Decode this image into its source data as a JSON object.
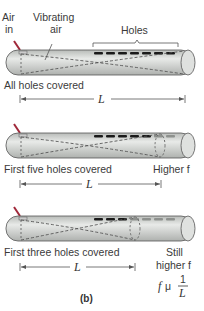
{
  "panel_label": "(b)",
  "labels": {
    "air_in": [
      "Air",
      "in"
    ],
    "vibrating_air": [
      "Vibrating",
      "air"
    ],
    "holes": "Holes",
    "length_symbol": "L"
  },
  "tubes": [
    {
      "caption": "All holes covered",
      "holes_total": 7,
      "holes_covered": 7,
      "right_note": []
    },
    {
      "caption": "First five holes covered",
      "holes_total": 7,
      "holes_covered": 5,
      "right_note": [
        "Higher f"
      ]
    },
    {
      "caption": "First three holes covered",
      "holes_total": 7,
      "holes_covered": 3,
      "right_note": [
        "Still",
        "higher f"
      ]
    }
  ],
  "formula": {
    "lhs": "f",
    "relation": "μ",
    "numerator": "1",
    "denominator": "L"
  },
  "colors": {
    "tube_fill": "#c9ccc9",
    "tube_light": "#e6e8e6",
    "tube_outline": "#555555",
    "hole_covered": "#1a1a1a",
    "hole_open": "#8e918e",
    "arrow_red": "#a0283a"
  }
}
